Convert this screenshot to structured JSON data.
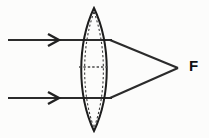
{
  "diagram": {
    "background_color": "#fcfcfb",
    "line_color": "#2b2b2b",
    "labels": {
      "focal_point": "F"
    },
    "lens": {
      "type": "biconvex-converging",
      "center_x": 94,
      "top_apex_y": 8,
      "bottom_apex_y": 131,
      "left_edge_x": 77,
      "right_edge_x": 111,
      "outer_surface_path": "M 94 8 C 77 44, 77 95, 94 131 C 111 95, 111 44, 94 8 Z",
      "inner_dashed_left_path": "M 94 12 C 81 46, 81 94, 94 128",
      "inner_dashed_right_path": "M 94 12 C 107 46, 107 94, 94 128",
      "axis_dash_y": 67,
      "axis_dash_x1": 79,
      "axis_dash_x2": 109
    },
    "rays": [
      {
        "name": "upper-incident-ray",
        "y": 40,
        "x_start": 8,
        "x_end": 112,
        "arrow_x": 55,
        "arrow_size": 9
      },
      {
        "name": "lower-incident-ray",
        "y": 98,
        "x_start": 8,
        "x_end": 112,
        "arrow_x": 55,
        "arrow_size": 9
      }
    ],
    "refracted_rays": [
      {
        "name": "upper-refracted-ray",
        "x1": 110,
        "y1": 40,
        "x2": 178,
        "y2": 68
      },
      {
        "name": "lower-refracted-ray",
        "x1": 110,
        "y1": 98,
        "x2": 178,
        "y2": 68
      }
    ],
    "focal_point": {
      "x": 178,
      "y": 68,
      "label_x": 189,
      "label_y": 67
    }
  }
}
